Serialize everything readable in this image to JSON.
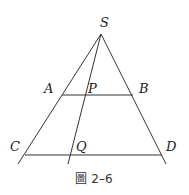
{
  "figure": {
    "caption": "圖 2–6",
    "points": {
      "S": "S",
      "A": "A",
      "B": "B",
      "P": "P",
      "C": "C",
      "D": "D",
      "Q": "Q"
    }
  }
}
